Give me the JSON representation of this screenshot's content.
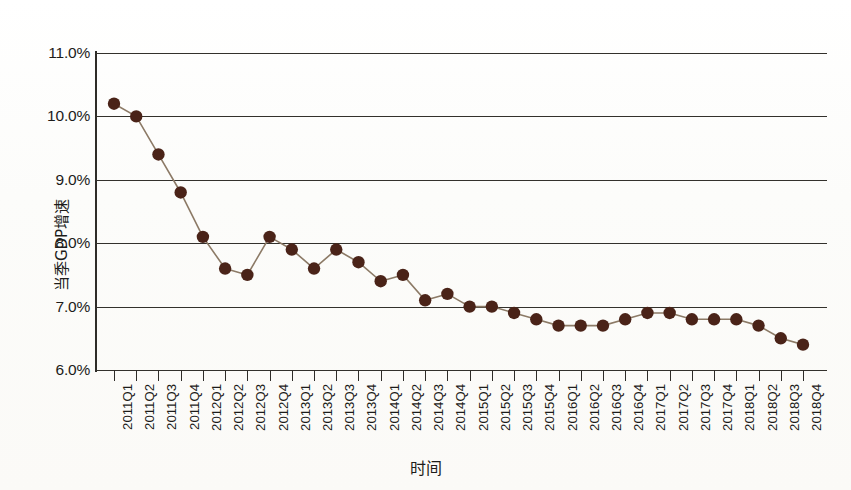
{
  "chart_data": {
    "type": "line",
    "title": "",
    "subtitle": "",
    "xlabel": "时间",
    "ylabel": "当季GDP增速",
    "ylim": [
      6.0,
      11.0
    ],
    "ytick_step": 1.0,
    "ytick_labels": [
      "11.0%",
      "10.0%",
      "9.0%",
      "8.0%",
      "7.0%",
      "6.0%"
    ],
    "ytick_values": [
      11.0,
      10.0,
      9.0,
      8.0,
      7.0,
      6.0
    ],
    "grid": "horizontal",
    "legend": "none",
    "marker": "filled-circle",
    "marker_color": "#4a2318",
    "line_color": "#8c7a66",
    "axis_color": "#2e2c28",
    "unit": "%",
    "categories": [
      "2011Q1",
      "2011Q2",
      "2011Q3",
      "2011Q4",
      "2012Q1",
      "2012Q2",
      "2012Q3",
      "2012Q4",
      "2013Q1",
      "2013Q2",
      "2013Q3",
      "2013Q4",
      "2014Q1",
      "2014Q2",
      "2014Q3",
      "2014Q4",
      "2015Q1",
      "2015Q2",
      "2015Q3",
      "2015Q4",
      "2016Q1",
      "2016Q2",
      "2016Q3",
      "2016Q4",
      "2017Q1",
      "2017Q2",
      "2017Q3",
      "2017Q4",
      "2018Q1",
      "2018Q2",
      "2018Q3",
      "2018Q4"
    ],
    "values": [
      10.2,
      10.0,
      9.4,
      8.8,
      8.1,
      7.6,
      7.5,
      8.1,
      7.9,
      7.6,
      7.9,
      7.7,
      7.4,
      7.5,
      7.1,
      7.2,
      7.0,
      7.0,
      6.9,
      6.8,
      6.7,
      6.7,
      6.7,
      6.8,
      6.9,
      6.9,
      6.8,
      6.8,
      6.8,
      6.7,
      6.5,
      6.4
    ]
  }
}
